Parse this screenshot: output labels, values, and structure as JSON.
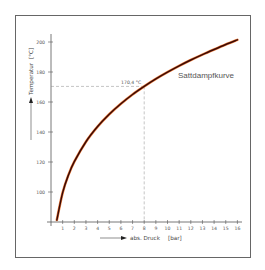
{
  "chart_data": {
    "type": "line",
    "title": "",
    "xlabel": "abs. Druck [bar]",
    "ylabel": "Temperatur [°C]",
    "x_ticks": [
      1,
      2,
      3,
      4,
      5,
      6,
      7,
      8,
      9,
      10,
      11,
      12,
      13,
      14,
      15,
      16
    ],
    "y_ticks": [
      100,
      120,
      140,
      160,
      180,
      200
    ],
    "xlim": [
      0,
      16
    ],
    "ylim": [
      80,
      205
    ],
    "grid": false,
    "series": [
      {
        "name": "Sattdampfkurve",
        "x": [
          0.5,
          1,
          1.5,
          2,
          3,
          4,
          5,
          6,
          7,
          8,
          9,
          10,
          11,
          12,
          13,
          14,
          15,
          16
        ],
        "y": [
          81.3,
          99.6,
          111.4,
          120.2,
          133.5,
          143.6,
          151.8,
          158.8,
          165.0,
          170.4,
          175.4,
          179.9,
          184.1,
          188.0,
          191.6,
          195.0,
          198.3,
          201.4
        ],
        "color": "#b03010"
      }
    ],
    "annotations": [
      {
        "text": "170,4 °C",
        "x": 8,
        "y": 170.4,
        "type": "dashed-guide"
      },
      {
        "text": "Sattdampfkurve",
        "x": 13,
        "y": 183,
        "type": "curve-label"
      }
    ]
  },
  "labels": {
    "ylabel_text": "Temperatur",
    "yunit": "[°C]",
    "xlabel_text": "abs. Druck",
    "xunit": "[bar]",
    "curve_name": "Sattdampfkurve",
    "annotation": "170,4 °C"
  }
}
